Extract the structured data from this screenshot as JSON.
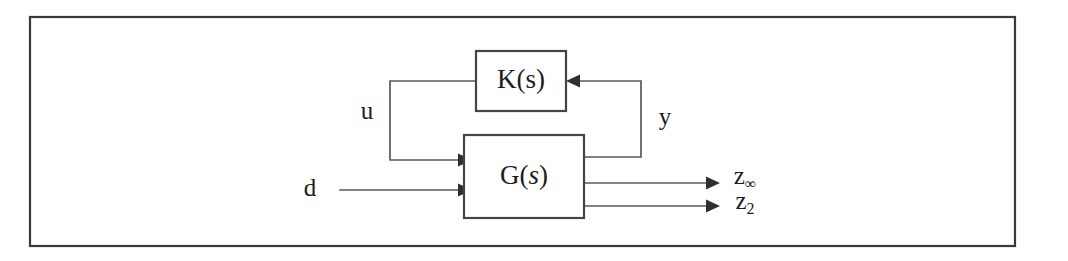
{
  "figure": {
    "kind": "control-system-block-diagram",
    "frame": {
      "border_color": "#3a3a3a",
      "background_color": "#ffffff"
    },
    "blocks": [
      {
        "id": "controller",
        "label_main": "K(",
        "label_var": "s",
        "label_close": ")",
        "label_text": "K(s)",
        "italic_variable": false
      },
      {
        "id": "plant",
        "label_main": "G(",
        "label_var": "s",
        "label_close": ")",
        "label_text": "G(s)",
        "italic_variable": true
      }
    ],
    "signals": [
      {
        "id": "u",
        "label": "u",
        "sub": "",
        "role": "control-input"
      },
      {
        "id": "y",
        "label": "y",
        "sub": "",
        "role": "measured-output"
      },
      {
        "id": "d",
        "label": "d",
        "sub": "",
        "role": "disturbance-input"
      },
      {
        "id": "z-inf",
        "label": "z",
        "sub": "∞",
        "role": "performance-output"
      },
      {
        "id": "z-two",
        "label": "z",
        "sub": "2",
        "role": "performance-output"
      }
    ],
    "colors": {
      "wire": "#5a5a5a",
      "block_stroke": "#444444",
      "text": "#1c1c1c",
      "arrow": "#2f2f2f"
    }
  }
}
